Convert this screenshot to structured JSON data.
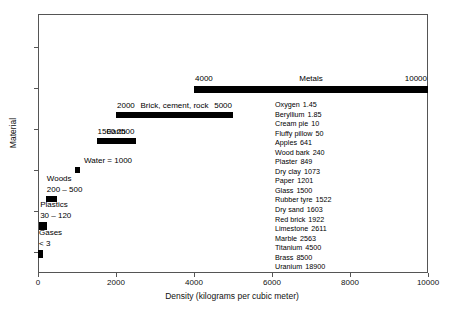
{
  "chart_data": {
    "type": "bar",
    "orientation": "horizontal",
    "title": "",
    "xlabel": "Density (kilograms per cubic meter)",
    "ylabel": "Material",
    "xlim": [
      0,
      10000
    ],
    "xticks": [
      0,
      2000,
      4000,
      6000,
      8000,
      10000
    ],
    "xticklabels": [
      "0",
      "2000",
      "4000",
      "6000",
      "8000",
      "10000"
    ],
    "yticklabels": [],
    "grid": false,
    "legend": false,
    "bar_color": "#000000",
    "ranges": [
      {
        "name": "Metals",
        "label": "Metals",
        "low": 4000,
        "high": 10000,
        "low_label": "4000",
        "high_label": "10000",
        "row": 0
      },
      {
        "name": "Brick, cement, rock",
        "label": "Brick, cement, rock",
        "low": 2000,
        "high": 5000,
        "low_label": "2000",
        "high_label": "5000",
        "row": 1
      },
      {
        "name": "Earth",
        "label": "Earth",
        "low": 1500,
        "high": 2500,
        "low_label": "1500",
        "high_label": "2500",
        "row": 2
      },
      {
        "name": "Water",
        "label": "Water = 1000",
        "low": 940,
        "high": 1080,
        "low_label": "",
        "high_label": "",
        "row": 3
      },
      {
        "name": "Woods",
        "label": "Woods",
        "range_label": "200 – 500",
        "low": 200,
        "high": 500,
        "low_label": "",
        "high_label": "",
        "row": 4
      },
      {
        "name": "Plastics",
        "label": "Plastics",
        "range_label": "30 – 120",
        "low": 30,
        "high": 220,
        "low_label": "",
        "high_label": "",
        "row": 5
      },
      {
        "name": "Gases",
        "label": "Gases",
        "range_label": "< 3",
        "low": 0,
        "high": 120,
        "low_label": "",
        "high_label": "",
        "row": 6
      }
    ],
    "annotation_list": [
      {
        "material": "Oxygen",
        "density": "1.45"
      },
      {
        "material": "Beryllium",
        "density": "1.85"
      },
      {
        "material": "Cream pie",
        "density": "10"
      },
      {
        "material": "Fluffy pillow",
        "density": "50"
      },
      {
        "material": "Apples",
        "density": "641"
      },
      {
        "material": "Wood bark",
        "density": "240"
      },
      {
        "material": "Plaster",
        "density": "849"
      },
      {
        "material": "Dry clay",
        "density": "1073"
      },
      {
        "material": "Paper",
        "density": "1201"
      },
      {
        "material": "Glass",
        "density": "1500"
      },
      {
        "material": "Rubber tyre",
        "density": "1522"
      },
      {
        "material": "Dry sand",
        "density": "1603"
      },
      {
        "material": "Red brick",
        "density": "1922"
      },
      {
        "material": "Limestone",
        "density": "2611"
      },
      {
        "material": "Marble",
        "density": "2563"
      },
      {
        "material": "Titanium",
        "density": "4500"
      },
      {
        "material": "Brass",
        "density": "8500"
      },
      {
        "material": "Uranium",
        "density": "18900"
      }
    ]
  },
  "axes": {
    "x_title": "Density (kilograms per cubic meter)",
    "y_title": "Material"
  }
}
